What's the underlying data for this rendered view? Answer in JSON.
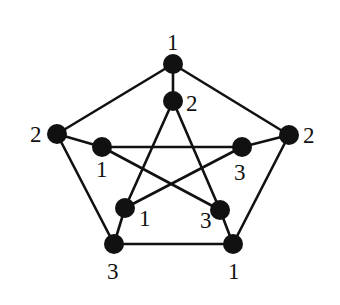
{
  "diagram": {
    "type": "graph",
    "node_radius": 10,
    "colors": {
      "node": "#111111",
      "edge": "#111111",
      "background": "#ffffff"
    },
    "nodes": [
      {
        "id": "o0",
        "ring": "outer",
        "position": "top",
        "x": 173,
        "y": 64,
        "label": "1",
        "label_x": 167,
        "label_y": 50
      },
      {
        "id": "o1",
        "ring": "outer",
        "position": "left",
        "x": 57,
        "y": 134,
        "label": "2",
        "label_x": 30,
        "label_y": 142
      },
      {
        "id": "o2",
        "ring": "outer",
        "position": "right",
        "x": 289,
        "y": 135,
        "label": "2",
        "label_x": 303,
        "label_y": 143
      },
      {
        "id": "o3",
        "ring": "outer",
        "position": "bottom-left",
        "x": 114,
        "y": 244,
        "label": "3",
        "label_x": 107,
        "label_y": 279
      },
      {
        "id": "o4",
        "ring": "outer",
        "position": "bottom-right",
        "x": 233,
        "y": 244,
        "label": "1",
        "label_x": 228,
        "label_y": 279
      },
      {
        "id": "i0",
        "ring": "inner",
        "position": "top",
        "x": 173,
        "y": 101,
        "label": "2",
        "label_x": 186,
        "label_y": 111
      },
      {
        "id": "i1",
        "ring": "inner",
        "position": "left",
        "x": 102,
        "y": 147,
        "label": "1",
        "label_x": 96,
        "label_y": 177
      },
      {
        "id": "i2",
        "ring": "inner",
        "position": "right",
        "x": 242,
        "y": 147,
        "label": "3",
        "label_x": 234,
        "label_y": 180
      },
      {
        "id": "i3",
        "ring": "inner",
        "position": "bottom-left",
        "x": 125,
        "y": 208,
        "label": "1",
        "label_x": 139,
        "label_y": 226
      },
      {
        "id": "i4",
        "ring": "inner",
        "position": "bottom-right",
        "x": 220,
        "y": 210,
        "label": "3",
        "label_x": 200,
        "label_y": 228
      }
    ],
    "edges": [
      {
        "from": "o0",
        "to": "o1",
        "kind": "outer-cycle"
      },
      {
        "from": "o0",
        "to": "o2",
        "kind": "outer-cycle"
      },
      {
        "from": "o1",
        "to": "o3",
        "kind": "outer-cycle"
      },
      {
        "from": "o2",
        "to": "o4",
        "kind": "outer-cycle"
      },
      {
        "from": "o3",
        "to": "o4",
        "kind": "outer-cycle"
      },
      {
        "from": "o0",
        "to": "i0",
        "kind": "spoke"
      },
      {
        "from": "o1",
        "to": "i1",
        "kind": "spoke"
      },
      {
        "from": "o2",
        "to": "i2",
        "kind": "spoke"
      },
      {
        "from": "o3",
        "to": "i3",
        "kind": "spoke"
      },
      {
        "from": "o4",
        "to": "i4",
        "kind": "spoke"
      },
      {
        "from": "i0",
        "to": "i3",
        "kind": "inner-star"
      },
      {
        "from": "i0",
        "to": "i4",
        "kind": "inner-star"
      },
      {
        "from": "i1",
        "to": "i2",
        "kind": "inner-star"
      },
      {
        "from": "i1",
        "to": "i4",
        "kind": "inner-star"
      },
      {
        "from": "i2",
        "to": "i3",
        "kind": "inner-star"
      }
    ]
  }
}
